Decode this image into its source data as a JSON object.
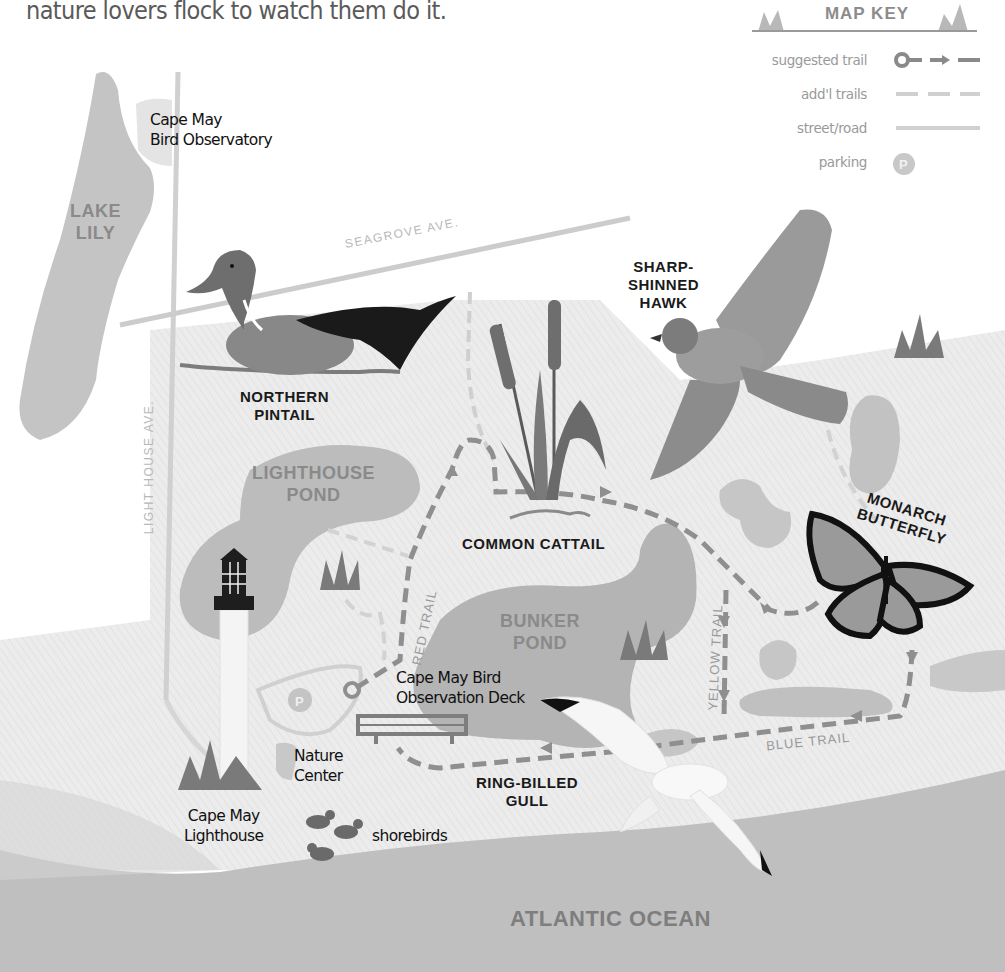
{
  "intro_text": "nature lovers flock to watch them do it.",
  "map_key": {
    "title": "MAP KEY",
    "items": [
      {
        "label": "suggested trail",
        "symbol": "circle-arrow-dash"
      },
      {
        "label": "add'l trails",
        "symbol": "light-dash"
      },
      {
        "label": "street/road",
        "symbol": "solid-line"
      },
      {
        "label": "parking",
        "symbol": "parking-circle",
        "glyph": "P"
      }
    ]
  },
  "streets": {
    "seagrove": "SEAGROVE AVE.",
    "lighthouse": "LIGHT HOUSE AVE."
  },
  "water_bodies": {
    "lake_lily": [
      "LAKE",
      "LILY"
    ],
    "lighthouse_pond": [
      "LIGHTHOUSE",
      "POND"
    ],
    "bunker_pond": [
      "BUNKER",
      "POND"
    ],
    "ocean": "ATLANTIC OCEAN"
  },
  "places": {
    "observatory": [
      "Cape May",
      "Bird Observatory"
    ],
    "deck": [
      "Cape May Bird",
      "Observation Deck"
    ],
    "nature_center": [
      "Nature",
      "Center"
    ],
    "lighthouse": [
      "Cape May",
      "Lighthouse"
    ],
    "shorebirds": "shorebirds",
    "parking_glyph": "P"
  },
  "species": {
    "pintail": [
      "NORTHERN",
      "PINTAIL"
    ],
    "hawk": [
      "SHARP-",
      "SHINNED",
      "HAWK"
    ],
    "cattail": "COMMON CATTAIL",
    "monarch": [
      "MONARCH",
      "BUTTERFLY"
    ],
    "gull": [
      "RING-BILLED",
      "GULL"
    ]
  },
  "trails": {
    "red": "RED TRAIL",
    "yellow": "YELLOW TRAIL",
    "blue": "BLUE TRAIL"
  },
  "colors": {
    "land": "#e9e9e9",
    "water": "#b9b9b9",
    "road": "#cfcfcf",
    "trail": "#8f8f8f",
    "ocean": "#bdbdbd"
  }
}
